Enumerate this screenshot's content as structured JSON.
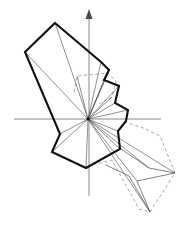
{
  "figure": {
    "width": 184,
    "height": 226,
    "background_color": "#ffffff"
  },
  "colors": {
    "outline_thick": "#111111",
    "spoke_thin": "#4a4a4a",
    "axis": "#8a8a8a",
    "dashed": "#9a9a9a",
    "secondary_thin": "#555555"
  },
  "axes": {
    "origin": {
      "x": 88,
      "y": 119
    },
    "x_axis": {
      "x1": 14,
      "y1": 119,
      "x2": 161,
      "y2": 119,
      "color": "#8a8a8a",
      "width": 1
    },
    "y_axis": {
      "x1": 89,
      "y1": 11,
      "x2": 89,
      "y2": 196,
      "color": "#8a8a8a",
      "width": 1
    },
    "arrowhead": {
      "points": "89,9 85.5,19 92.5,19",
      "color": "#4a4a4a",
      "direction": "up"
    }
  },
  "chart_data": {
    "type": "line",
    "xlabel": "",
    "ylabel": "",
    "grid": false,
    "legend": "none",
    "origin": [
      88,
      119
    ],
    "series": [
      {
        "name": "main-polygon",
        "style": "solid-thick",
        "color": "#111111",
        "closed": true,
        "points": [
          [
            55,
            23
          ],
          [
            101,
            62
          ],
          [
            109,
            70
          ],
          [
            104,
            80
          ],
          [
            119,
            86
          ],
          [
            115,
            103
          ],
          [
            128,
            110
          ],
          [
            126,
            121
          ],
          [
            118,
            131
          ],
          [
            120,
            149
          ],
          [
            86,
            168
          ],
          [
            52,
            152
          ],
          [
            60,
            134
          ],
          [
            25,
            52
          ]
        ]
      },
      {
        "name": "dashed-upper-polygon",
        "style": "dashed",
        "color": "#9a9a9a",
        "closed": false,
        "points": [
          [
            74,
            92
          ],
          [
            77,
            76
          ],
          [
            108,
            73
          ],
          [
            116,
            81
          ],
          [
            112,
            97
          ],
          [
            99,
            104
          ]
        ]
      },
      {
        "name": "dashed-lower-right-polygon",
        "style": "dashed",
        "color": "#9a9a9a",
        "closed": false,
        "points": [
          [
            124,
            122
          ],
          [
            141,
            127
          ],
          [
            160,
            136
          ],
          [
            175,
            173
          ],
          [
            150,
            212
          ],
          [
            139,
            209
          ],
          [
            112,
            160
          ],
          [
            95,
            164
          ]
        ]
      },
      {
        "name": "thin-lower-right-polygon",
        "style": "solid-thin",
        "color": "#555555",
        "closed": false,
        "points": [
          [
            121,
            149
          ],
          [
            149,
            168
          ],
          [
            175,
            173
          ],
          [
            137,
            181
          ],
          [
            150,
            212
          ],
          [
            129,
            176
          ],
          [
            106,
            165
          ]
        ]
      }
    ],
    "spokes": {
      "name": "radial-spokes",
      "color": "#4a4a4a",
      "from": [
        88,
        119
      ],
      "to": [
        [
          55,
          23
        ],
        [
          25,
          52
        ],
        [
          60,
          134
        ],
        [
          52,
          152
        ],
        [
          86,
          168
        ],
        [
          120,
          149
        ],
        [
          118,
          131
        ],
        [
          128,
          110
        ],
        [
          115,
          103
        ],
        [
          119,
          86
        ],
        [
          104,
          80
        ],
        [
          109,
          70
        ],
        [
          101,
          62
        ],
        [
          175,
          173
        ],
        [
          150,
          212
        ],
        [
          137,
          181
        ],
        [
          149,
          168
        ],
        [
          112,
          97
        ],
        [
          77,
          76
        ],
        [
          108,
          73
        ]
      ]
    }
  },
  "elements": {
    "main_polygon_label": "main-polygon",
    "dashed_upper_label": "dashed-upper-polygon",
    "dashed_lower_label": "dashed-lower-right-polygon",
    "spokes_label": "radial-spokes",
    "x_axis_label": "x-axis",
    "y_axis_label": "y-axis",
    "origin_label": "origin-point"
  }
}
